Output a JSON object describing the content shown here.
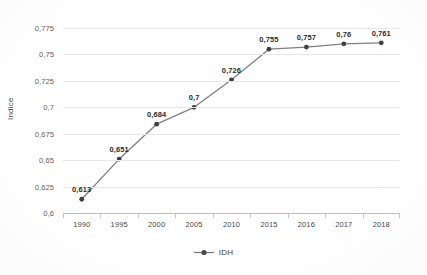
{
  "chart_data": {
    "type": "line",
    "title": "",
    "xlabel": "",
    "ylabel": "Indice",
    "categories": [
      "1990",
      "1995",
      "2000",
      "2005",
      "2010",
      "2015",
      "2016",
      "2017",
      "2018"
    ],
    "series": [
      {
        "name": "IDH",
        "values": [
          0.613,
          0.651,
          0.684,
          0.7,
          0.726,
          0.755,
          0.757,
          0.76,
          0.761
        ],
        "labels": [
          "0,613",
          "0,651",
          "0,684",
          "0,7",
          "0,726",
          "0,755",
          "0,757",
          "0,76",
          "0,761"
        ],
        "color": "#808080",
        "marker_color": "#404040"
      }
    ],
    "ylim": [
      0.6,
      0.775
    ],
    "ytick_values": [
      0.6,
      0.625,
      0.65,
      0.675,
      0.7,
      0.725,
      0.75,
      0.775
    ],
    "ytick_labels": [
      "0,6",
      "0,625",
      "0,65",
      "0,675",
      "0,7",
      "0,725",
      "0,75",
      "0,775"
    ],
    "grid": true,
    "legend_position": "bottom",
    "decimal_separator": ","
  },
  "legend": {
    "entries": [
      {
        "label": "IDH",
        "marker": "line-marker-icon"
      }
    ]
  },
  "axes": {
    "y_title": "Indice"
  }
}
